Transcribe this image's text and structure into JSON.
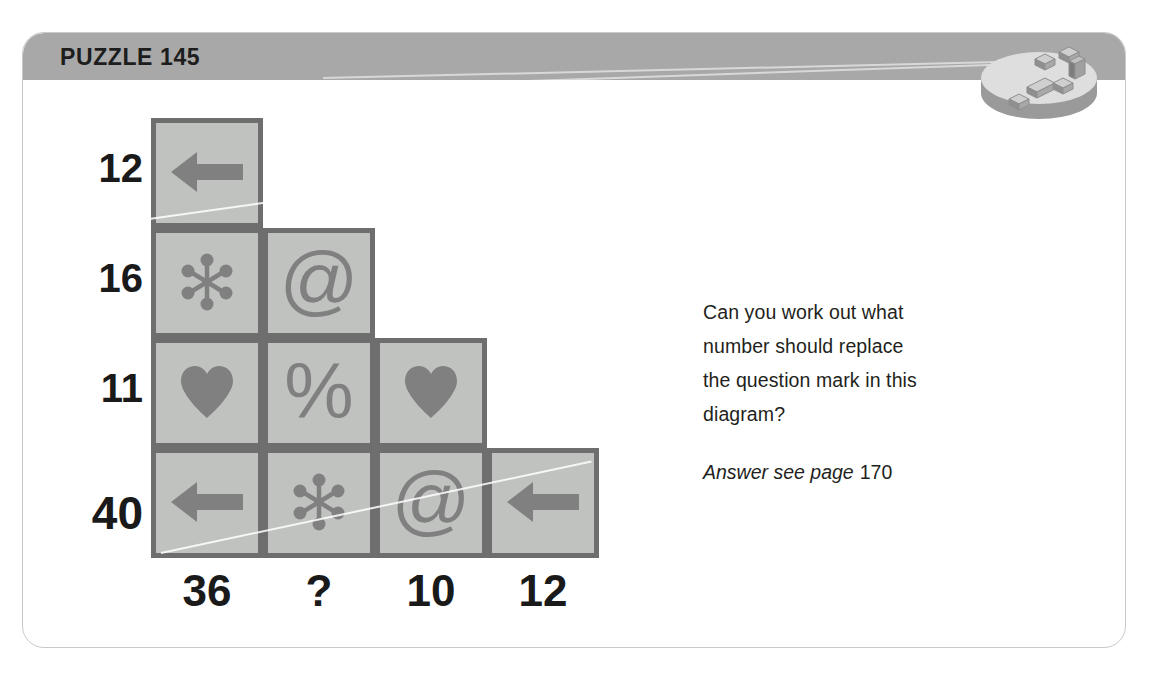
{
  "header": {
    "title": "PUZZLE 145",
    "band_color": "#a8a8a8",
    "title_color": "#1d1d1d"
  },
  "badge": {
    "name": "blocks-disc-badge",
    "disc_top_color": "#dcdcdc",
    "disc_side_color": "#9a9a9a",
    "block_color": "#b5b5b5"
  },
  "puzzle": {
    "grid": {
      "cell_fill": "#c0c2c0",
      "cell_border": "#6e6e6e",
      "symbol_color": "#808080",
      "rows": [
        {
          "label": "12",
          "cells": [
            "arrow-left"
          ]
        },
        {
          "label": "16",
          "cells": [
            "asterisk",
            "at-sign"
          ]
        },
        {
          "label": "11",
          "cells": [
            "heart",
            "percent",
            "heart"
          ]
        },
        {
          "label": "40",
          "cells": [
            "arrow-left",
            "asterisk",
            "at-sign",
            "arrow-left"
          ]
        }
      ],
      "row_labels": [
        "12",
        "16",
        "11",
        "40"
      ],
      "column_labels": [
        "36",
        "?",
        "10",
        "12"
      ]
    }
  },
  "question": {
    "lines": [
      "Can you work out what",
      "number should replace",
      "the question mark in this",
      "diagram?"
    ],
    "answer_prefix": "Answer see page",
    "answer_page": "170"
  }
}
